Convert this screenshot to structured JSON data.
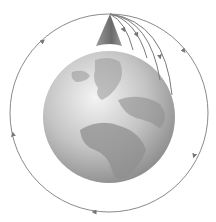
{
  "diagram": {
    "elements": {
      "earth": {
        "label": "Earth globe",
        "fill": "#bdbdbd",
        "land": "#8e8e8e"
      },
      "mountain": {
        "label": "Mountain peak",
        "fill": "#7a7a7a"
      },
      "orbit": {
        "label": "Circular orbit",
        "stroke": "#888888"
      },
      "trajectories": [
        {
          "label": "Trajectory 1"
        },
        {
          "label": "Trajectory 2"
        },
        {
          "label": "Trajectory 3"
        },
        {
          "label": "Trajectory 4"
        }
      ]
    },
    "caption": ""
  }
}
